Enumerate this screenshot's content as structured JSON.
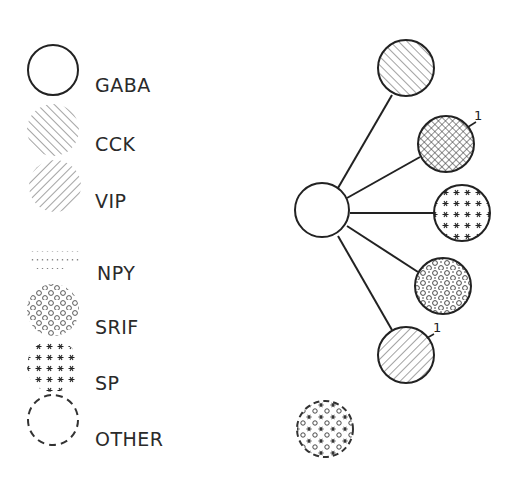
{
  "legend": {
    "items": [
      {
        "key": "gaba",
        "label": "GABA",
        "pattern": "open-circle"
      },
      {
        "key": "cck",
        "label": "CCK",
        "pattern": "diagonal-lines-forward"
      },
      {
        "key": "vip",
        "label": "VIP",
        "pattern": "diagonal-lines-backward"
      },
      {
        "key": "npy",
        "label": "NPY",
        "pattern": "dotted-rows"
      },
      {
        "key": "srif",
        "label": "SRIF",
        "pattern": "small-circles"
      },
      {
        "key": "sp",
        "label": "SP",
        "pattern": "asterisks"
      },
      {
        "key": "other",
        "label": "OTHER",
        "pattern": "dashed-outline"
      }
    ]
  },
  "diagram": {
    "center_node": {
      "type": "GABA"
    },
    "branches": [
      {
        "type": "CCK",
        "annotation": ""
      },
      {
        "type": "CCK+VIP",
        "annotation": "1"
      },
      {
        "type": "SP",
        "annotation": ""
      },
      {
        "type": "SRIF+NPY",
        "annotation": ""
      },
      {
        "type": "VIP",
        "annotation": "1"
      }
    ],
    "standalone_node": {
      "type": "OTHER+SRIF+SP"
    }
  }
}
